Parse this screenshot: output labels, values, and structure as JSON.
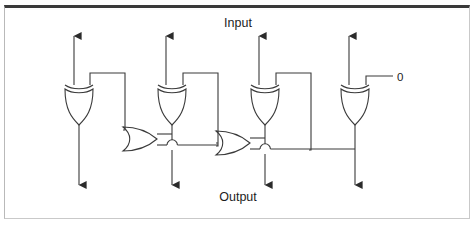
{
  "figure": {
    "title_top": "Input",
    "title_bottom": "Output",
    "constant_label": "0",
    "background_color": "#ffffff",
    "line_color": "#3a3a3a",
    "frame_top_color": "#3a3a3a",
    "frame_side_color": "#c2c2c2",
    "text_color": "#1c1c1c"
  },
  "circuit": {
    "type": "logic-gate-diagram",
    "description": "Four XOR gates fed by four top inputs, chained through two OR gates, producing four bottom outputs; rightmost XOR has a constant 0 input.",
    "gate_count": 6,
    "input_count": 4,
    "output_count": 4,
    "gates": [
      {
        "id": "xor-1",
        "kind": "xor",
        "orientation": "down",
        "x": 79,
        "y": 100
      },
      {
        "id": "xor-2",
        "kind": "xor",
        "orientation": "down",
        "x": 172,
        "y": 100
      },
      {
        "id": "xor-3",
        "kind": "xor",
        "orientation": "down",
        "x": 265,
        "y": 100
      },
      {
        "id": "xor-4",
        "kind": "xor",
        "orientation": "down",
        "x": 355,
        "y": 100
      },
      {
        "id": "or-1",
        "kind": "or",
        "orientation": "right",
        "x": 140,
        "y": 139
      },
      {
        "id": "or-2",
        "kind": "or",
        "orientation": "right",
        "x": 233,
        "y": 143
      }
    ],
    "inputs": [
      {
        "id": "input-1",
        "x": 74,
        "y_top": 36
      },
      {
        "id": "input-2",
        "x": 166,
        "y_top": 36
      },
      {
        "id": "input-3",
        "x": 259,
        "y_top": 36
      },
      {
        "id": "input-4",
        "x": 349,
        "y_top": 36
      }
    ],
    "outputs": [
      {
        "id": "output-1",
        "x": 79,
        "y_bottom": 185
      },
      {
        "id": "output-2",
        "x": 172,
        "y_bottom": 185
      },
      {
        "id": "output-3",
        "x": 265,
        "y_bottom": 185
      },
      {
        "id": "output-4",
        "x": 355,
        "y_bottom": 185
      }
    ],
    "wire_hops": [
      {
        "id": "hop-1",
        "x": 172,
        "y": 145
      },
      {
        "id": "hop-2",
        "x": 265,
        "y": 149
      }
    ]
  }
}
